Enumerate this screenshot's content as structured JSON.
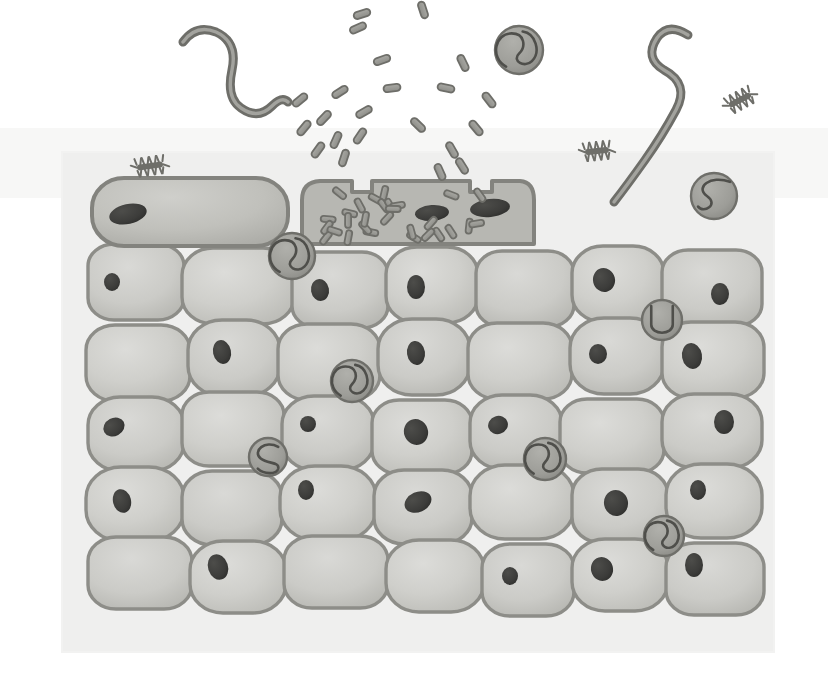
{
  "figure": {
    "canvas": {
      "width": 828,
      "height": 698
    },
    "style": "grayscale biomedical line illustration",
    "colors": {
      "page_background": "#ffffff",
      "panel_background": "#efefee",
      "panel_background_upper": "#f4f4f3",
      "cell_fill_light": "#d2d2cf",
      "cell_fill_mid": "#c6c6c2",
      "cell_fill_dark": "#b6b6b1",
      "cell_outline": "#8d8d88",
      "cell_outline_dark": "#7c7c77",
      "nucleus_fill": "#3b3b39",
      "nucleus_fill_soft": "#4a4a47",
      "organism_stroke": "#6e6e69",
      "organism_fill": "#9a9a95",
      "cyst_fill": "#9d9d98",
      "cyst_stroke": "#6f6f6a",
      "bacillus_fill": "#9a9a95",
      "bacillus_stroke": "#6e6e69",
      "infected_cell_fill": "#b0b0ab",
      "top_cell_fill": "#bcbcb7"
    },
    "panel": {
      "x": 62,
      "y": 152,
      "width": 712,
      "height": 500
    }
  },
  "legend_semantics": {
    "tissue": "stratified squamous epithelium, 6 visible cell layers",
    "top_layer": "flattened surface cells, one ruptured and packed with bacteria",
    "free_pathogens": "rod-shaped bacilli erupting from the lysed surface cell",
    "worms": "two free-swimming serpentine nematode larvae above the tissue",
    "cysts": "round encysted larvae embedded among the epithelial cells",
    "ciliates": "three small bristled ciliate organisms near the tissue surface"
  },
  "tissue": {
    "label": "stratified epithelium",
    "surface_cells": [
      {
        "id": "surface-cell-left",
        "x": 92,
        "y": 178,
        "w": 196,
        "h": 68,
        "rx": 32,
        "state": "intact",
        "nucleus": {
          "cx": 128,
          "cy": 214,
          "rx": 19,
          "ry": 10,
          "rot": -12
        }
      },
      {
        "id": "surface-cell-infected",
        "x": 300,
        "y": 180,
        "w": 232,
        "h": 64,
        "rx": 16,
        "state": "ruptured-infected",
        "nuclei": [
          {
            "cx": 432,
            "cy": 213,
            "rx": 17,
            "ry": 8,
            "rot": -4
          },
          {
            "cx": 490,
            "cy": 208,
            "rx": 20,
            "ry": 9,
            "rot": -6
          }
        ]
      }
    ],
    "rows": [
      {
        "row": 1,
        "y": 248,
        "h": 76,
        "cells": [
          {
            "x": 88,
            "w": 96,
            "nucleus": {
              "dx": 24,
              "dy": 38,
              "rx": 8,
              "ry": 9,
              "rot": 0
            }
          },
          {
            "x": 182,
            "w": 112,
            "nucleus": null
          },
          {
            "x": 292,
            "w": 96,
            "nucleus": {
              "dx": 28,
              "dy": 38,
              "rx": 9,
              "ry": 11,
              "rot": -10
            }
          },
          {
            "x": 386,
            "w": 92,
            "nucleus": {
              "dx": 30,
              "dy": 40,
              "rx": 9,
              "ry": 12,
              "rot": 0
            }
          },
          {
            "x": 476,
            "w": 98,
            "nucleus": null
          },
          {
            "x": 572,
            "w": 92,
            "nucleus": {
              "dx": 32,
              "dy": 34,
              "rx": 11,
              "ry": 12,
              "rot": -14
            }
          },
          {
            "x": 662,
            "w": 100,
            "nucleus": {
              "dx": 58,
              "dy": 44,
              "rx": 9,
              "ry": 11,
              "rot": 0
            }
          }
        ]
      },
      {
        "row": 2,
        "y": 322,
        "h": 76,
        "cells": [
          {
            "x": 86,
            "w": 104,
            "nucleus": null
          },
          {
            "x": 188,
            "w": 92,
            "nucleus": {
              "dx": 34,
              "dy": 32,
              "rx": 9,
              "ry": 12,
              "rot": -12
            }
          },
          {
            "x": 278,
            "w": 102,
            "nucleus": null
          },
          {
            "x": 378,
            "w": 92,
            "nucleus": {
              "dx": 38,
              "dy": 34,
              "rx": 9,
              "ry": 12,
              "rot": -8
            }
          },
          {
            "x": 468,
            "w": 104,
            "nucleus": null
          },
          {
            "x": 570,
            "w": 94,
            "nucleus": {
              "dx": 28,
              "dy": 36,
              "rx": 9,
              "ry": 10,
              "rot": 0
            }
          },
          {
            "x": 662,
            "w": 102,
            "nucleus": {
              "dx": 30,
              "dy": 34,
              "rx": 10,
              "ry": 13,
              "rot": -10
            }
          }
        ]
      },
      {
        "row": 3,
        "y": 396,
        "h": 74,
        "cells": [
          {
            "x": 88,
            "w": 96,
            "nucleus": {
              "dx": 26,
              "dy": 30,
              "rx": 11,
              "ry": 9,
              "rot": -28
            }
          },
          {
            "x": 182,
            "w": 102,
            "nucleus": null
          },
          {
            "x": 282,
            "w": 92,
            "nucleus": {
              "dx": 26,
              "dy": 28,
              "rx": 8,
              "ry": 8,
              "rot": 0
            }
          },
          {
            "x": 372,
            "w": 100,
            "nucleus": {
              "dx": 44,
              "dy": 32,
              "rx": 12,
              "ry": 13,
              "rot": -20
            }
          },
          {
            "x": 470,
            "w": 92,
            "nucleus": {
              "dx": 28,
              "dy": 30,
              "rx": 10,
              "ry": 9,
              "rot": -18
            }
          },
          {
            "x": 560,
            "w": 104,
            "nucleus": null
          },
          {
            "x": 662,
            "w": 100,
            "nucleus": {
              "dx": 62,
              "dy": 28,
              "rx": 10,
              "ry": 12,
              "rot": 0
            }
          }
        ]
      },
      {
        "row": 4,
        "y": 468,
        "h": 74,
        "cells": [
          {
            "x": 86,
            "w": 98,
            "nucleus": {
              "dx": 36,
              "dy": 34,
              "rx": 9,
              "ry": 12,
              "rot": -14
            }
          },
          {
            "x": 182,
            "w": 100,
            "nucleus": null
          },
          {
            "x": 280,
            "w": 96,
            "nucleus": {
              "dx": 26,
              "dy": 24,
              "rx": 8,
              "ry": 10,
              "rot": 0
            }
          },
          {
            "x": 374,
            "w": 98,
            "nucleus": {
              "dx": 44,
              "dy": 32,
              "rx": 14,
              "ry": 10,
              "rot": -24
            }
          },
          {
            "x": 470,
            "w": 104,
            "nucleus": null
          },
          {
            "x": 572,
            "w": 96,
            "nucleus": {
              "dx": 44,
              "dy": 34,
              "rx": 12,
              "ry": 13,
              "rot": -12
            }
          },
          {
            "x": 666,
            "w": 96,
            "nucleus": {
              "dx": 32,
              "dy": 26,
              "rx": 8,
              "ry": 10,
              "rot": 0
            }
          }
        ]
      },
      {
        "row": 5,
        "y": 540,
        "h": 72,
        "cells": [
          {
            "x": 88,
            "w": 104,
            "nucleus": null
          },
          {
            "x": 190,
            "w": 96,
            "nucleus": {
              "dx": 28,
              "dy": 26,
              "rx": 10,
              "ry": 13,
              "rot": -18
            }
          },
          {
            "x": 284,
            "w": 104,
            "nucleus": null
          },
          {
            "x": 386,
            "w": 98,
            "nucleus": null
          },
          {
            "x": 482,
            "w": 92,
            "nucleus": {
              "dx": 28,
              "dy": 32,
              "rx": 8,
              "ry": 9,
              "rot": 0
            }
          },
          {
            "x": 572,
            "w": 96,
            "nucleus": {
              "dx": 30,
              "dy": 30,
              "rx": 11,
              "ry": 12,
              "rot": -16
            }
          },
          {
            "x": 666,
            "w": 98,
            "nucleus": {
              "dx": 28,
              "dy": 22,
              "rx": 9,
              "ry": 12,
              "rot": 0
            }
          }
        ]
      }
    ]
  },
  "cysts": [
    {
      "id": "cyst-surface-right",
      "cx": 519,
      "cy": 50,
      "r": 24,
      "coil": "double-loop"
    },
    {
      "id": "cyst-right-upper",
      "cx": 714,
      "cy": 196,
      "r": 23,
      "coil": "s-curve"
    },
    {
      "id": "cyst-under-surface",
      "cx": 292,
      "cy": 256,
      "r": 23,
      "coil": "double-loop"
    },
    {
      "id": "cyst-right-row1",
      "cx": 662,
      "cy": 320,
      "r": 20,
      "coil": "u-shape"
    },
    {
      "id": "cyst-mid-left",
      "cx": 352,
      "cy": 381,
      "r": 21,
      "coil": "double-loop"
    },
    {
      "id": "cyst-mid-small",
      "cx": 268,
      "cy": 457,
      "r": 19,
      "coil": "c-curve"
    },
    {
      "id": "cyst-mid-right",
      "cx": 545,
      "cy": 459,
      "r": 21,
      "coil": "double-loop"
    },
    {
      "id": "cyst-lower-right",
      "cx": 664,
      "cy": 536,
      "r": 20,
      "coil": "double-loop"
    }
  ],
  "worms": [
    {
      "id": "worm-left",
      "label": "free nematode larva (left)",
      "stroke_width": 9
    },
    {
      "id": "worm-right",
      "label": "free nematode larva (right)",
      "stroke_width": 9
    }
  ],
  "ciliates": [
    {
      "id": "ciliate-left",
      "cx": 150,
      "cy": 166,
      "rot": -8,
      "len": 26
    },
    {
      "id": "ciliate-mid",
      "cx": 597,
      "cy": 151,
      "rot": -6,
      "len": 24
    },
    {
      "id": "ciliate-right",
      "cx": 740,
      "cy": 100,
      "rot": -28,
      "len": 24
    }
  ],
  "bacteria": {
    "label": "rod-shaped bacilli",
    "free_count": 22,
    "intracellular_count": 34,
    "rod_length": 17,
    "rod_width": 7,
    "free_rods": [
      {
        "x": 362,
        "y": 14,
        "rot": -18
      },
      {
        "x": 423,
        "y": 10,
        "rot": 72
      },
      {
        "x": 358,
        "y": 28,
        "rot": -24
      },
      {
        "x": 463,
        "y": 63,
        "rot": 64
      },
      {
        "x": 340,
        "y": 92,
        "rot": -32
      },
      {
        "x": 392,
        "y": 88,
        "rot": -8
      },
      {
        "x": 300,
        "y": 100,
        "rot": -40
      },
      {
        "x": 446,
        "y": 88,
        "rot": 12
      },
      {
        "x": 489,
        "y": 100,
        "rot": 52
      },
      {
        "x": 324,
        "y": 118,
        "rot": -46
      },
      {
        "x": 364,
        "y": 112,
        "rot": -30
      },
      {
        "x": 360,
        "y": 136,
        "rot": -56
      },
      {
        "x": 336,
        "y": 140,
        "rot": -66
      },
      {
        "x": 418,
        "y": 125,
        "rot": 44
      },
      {
        "x": 452,
        "y": 150,
        "rot": 60
      },
      {
        "x": 344,
        "y": 158,
        "rot": -72
      },
      {
        "x": 440,
        "y": 172,
        "rot": 66
      },
      {
        "x": 462,
        "y": 166,
        "rot": 58
      },
      {
        "x": 318,
        "y": 150,
        "rot": -54
      },
      {
        "x": 382,
        "y": 60,
        "rot": -20
      },
      {
        "x": 476,
        "y": 128,
        "rot": 50
      },
      {
        "x": 304,
        "y": 128,
        "rot": -50
      }
    ]
  }
}
